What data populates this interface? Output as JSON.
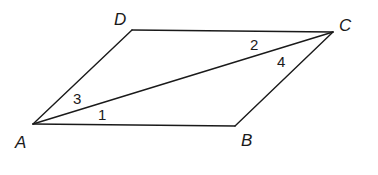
{
  "figure": {
    "vertices": {
      "A": {
        "label": "A",
        "x": 33,
        "y": 124
      },
      "B": {
        "label": "B",
        "x": 235,
        "y": 126
      },
      "C": {
        "label": "C",
        "x": 333,
        "y": 32
      },
      "D": {
        "label": "D",
        "x": 132,
        "y": 30
      }
    },
    "edges": [
      [
        "A",
        "B"
      ],
      [
        "B",
        "C"
      ],
      [
        "C",
        "D"
      ],
      [
        "D",
        "A"
      ],
      [
        "A",
        "C"
      ]
    ],
    "angles": [
      {
        "label": "1",
        "at": "A",
        "between": "AB and AC"
      },
      {
        "label": "2",
        "at": "C",
        "between": "CD and CA"
      },
      {
        "label": "3",
        "at": "A",
        "between": "AD and AC"
      },
      {
        "label": "4",
        "at": "C",
        "between": "CB and CA"
      }
    ],
    "stroke_color": "#1a1a1a",
    "background": "#ffffff"
  }
}
